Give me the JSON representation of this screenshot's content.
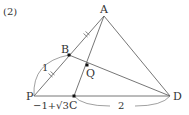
{
  "problem_number": "(2)",
  "points": {
    "A": {
      "label": "A",
      "x": 104,
      "y": 16
    },
    "B": {
      "label": "B",
      "x": 69,
      "y": 55
    },
    "Q": {
      "label": "Q",
      "x": 87,
      "y": 65
    },
    "C": {
      "label": "C",
      "x": 74,
      "y": 96
    },
    "P": {
      "label": "P",
      "x": 34,
      "y": 96
    },
    "D": {
      "label": "D",
      "x": 170,
      "y": 96
    }
  },
  "segments": [
    [
      "A",
      "P"
    ],
    [
      "A",
      "C"
    ],
    [
      "A",
      "D"
    ],
    [
      "P",
      "D"
    ],
    [
      "B",
      "D"
    ]
  ],
  "measurements": {
    "PB": "1",
    "PC": "−1+√3",
    "CD": "2"
  },
  "equal_marks": [
    "AB",
    "BP"
  ],
  "colors": {
    "line": "#555555",
    "text": "#333333",
    "point": "#111111"
  }
}
